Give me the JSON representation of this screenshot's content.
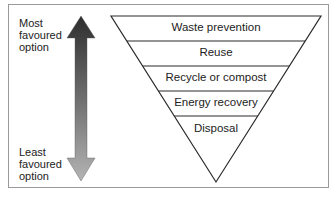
{
  "diagram": {
    "type": "waste-hierarchy",
    "arrow": {
      "top_label": [
        "Most",
        "favoured",
        "option"
      ],
      "bottom_label": [
        "Least",
        "favoured",
        "option"
      ],
      "gradient_top": "#2e2e2e",
      "gradient_bottom": "#b4b4b4"
    },
    "hierarchy": [
      {
        "label": "Waste prevention"
      },
      {
        "label": "Reuse"
      },
      {
        "label": "Recycle or compost"
      },
      {
        "label": "Energy recovery"
      },
      {
        "label": "Disposal"
      }
    ],
    "colors": {
      "line": "#2a2a2a",
      "frame": "#9a9a9a",
      "text": "#222222"
    }
  }
}
